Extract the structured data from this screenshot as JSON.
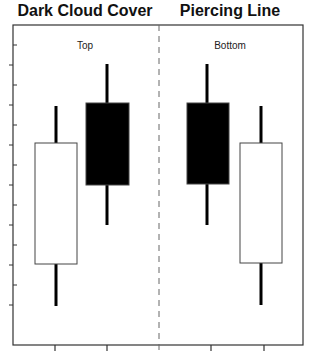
{
  "chart_data": [
    {
      "type": "candlestick",
      "title": "Dark Cloud Cover",
      "annotation": "Top",
      "xlabel": "",
      "ylabel": "",
      "grid": false,
      "candles": [
        {
          "index": 1,
          "color": "white",
          "direction": "up",
          "open": 264,
          "close": 143,
          "high": 106,
          "low": 306
        },
        {
          "index": 2,
          "color": "black",
          "direction": "down",
          "open": 103,
          "close": 185,
          "high": 64,
          "low": 225
        }
      ],
      "note": "values are pixel y-coordinates (smaller = higher price); no numeric tick labels shown"
    },
    {
      "type": "candlestick",
      "title": "Piercing Line",
      "annotation": "Bottom",
      "xlabel": "",
      "ylabel": "",
      "grid": false,
      "candles": [
        {
          "index": 1,
          "color": "black",
          "direction": "down",
          "open": 103,
          "close": 184,
          "high": 64,
          "low": 225
        },
        {
          "index": 2,
          "color": "white",
          "direction": "up",
          "open": 263,
          "close": 143,
          "high": 106,
          "low": 305
        }
      ],
      "note": "values are pixel y-coordinates (smaller = higher price); no numeric tick labels shown"
    }
  ],
  "titles": {
    "left": "Dark Cloud Cover",
    "right": "Piercing Line"
  },
  "annotations": {
    "left": "Top",
    "right": "Bottom"
  },
  "colors": {
    "bullish_body": "#ffffff",
    "bearish_body": "#000000",
    "wick": "#000000",
    "frame": "#333333"
  }
}
